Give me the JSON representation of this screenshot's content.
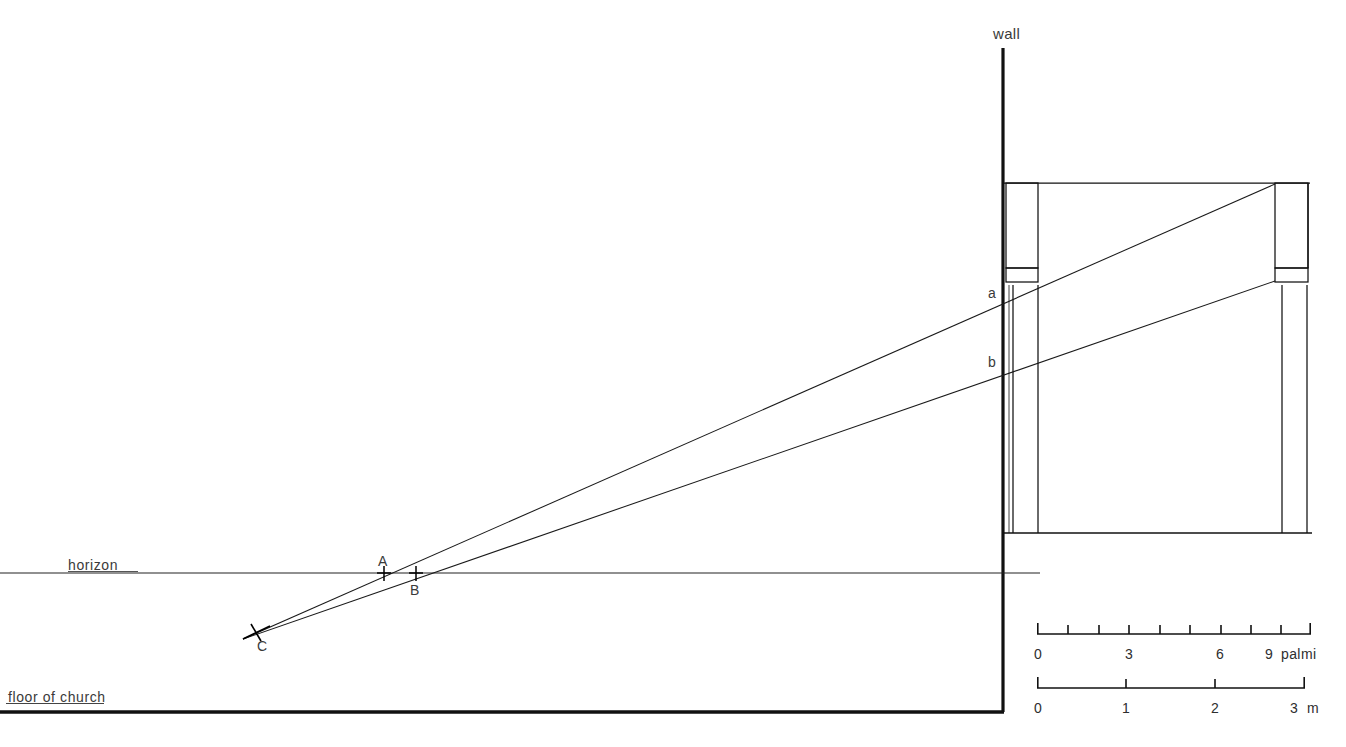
{
  "figure": {
    "type": "architectural-perspective-section-diagram",
    "background_color": "#ffffff",
    "line_color": "#000000",
    "text_color": "#333333",
    "width": 1346,
    "height": 747
  },
  "labels": {
    "wall": "wall",
    "horizon": "horizon",
    "floor_of_church": "floor of church",
    "point_a_lower": "a",
    "point_b_lower": "b",
    "point_A": "A",
    "point_B": "B",
    "point_C": "C"
  },
  "scales": [
    {
      "name": "palmi-scale",
      "unit": "palmi",
      "unit_label": "palmi",
      "ticks": [
        0,
        1,
        2,
        3,
        4,
        5,
        6,
        7,
        8,
        9
      ],
      "major_ticks": [
        0,
        3,
        6,
        9
      ],
      "tick_labels": [
        "0",
        "3",
        "6",
        "9"
      ],
      "label_positions": [
        0,
        3,
        6,
        9
      ],
      "x_start_px": 1037,
      "x_end_px": 1311,
      "y_px": 634,
      "tick_label_y_px": 651
    },
    {
      "name": "metre-scale",
      "unit": "m",
      "unit_label": "m",
      "ticks": [
        0,
        1,
        2,
        3
      ],
      "major_ticks": [
        0,
        1,
        2,
        3
      ],
      "tick_labels": [
        "0",
        "1",
        "2",
        "3"
      ],
      "label_positions": [
        0,
        1,
        2,
        3
      ],
      "x_start_px": 1037,
      "x_end_px": 1305,
      "y_px": 688,
      "tick_label_y_px": 705
    }
  ],
  "geometry": {
    "wall": {
      "x": 1003,
      "y_top": 48,
      "y_bottom": 712,
      "stroke_width": 3.2
    },
    "floor_line": {
      "x_start": 0,
      "x_end": 1004,
      "y": 712,
      "stroke_width": 3.4
    },
    "floor_label_underline": {
      "x_start": 6,
      "x_end": 104,
      "y": 703
    },
    "horizon_line": {
      "x_start": 0,
      "x_end": 1040,
      "y": 573,
      "stroke_width": 1.1
    },
    "horizon_label_underline": {
      "x_start": 68,
      "x_end": 138,
      "y": 571
    },
    "vanishing_point_C": {
      "x": 256,
      "y": 632
    },
    "markers": [
      {
        "name": "A",
        "x": 384,
        "y": 573,
        "angle_deg": 0,
        "size": 13
      },
      {
        "name": "B",
        "x": 416,
        "y": 573,
        "angle_deg": 0,
        "size": 13
      },
      {
        "name": "C",
        "x": 256,
        "y": 632,
        "angle_deg": 28,
        "size": 14
      }
    ],
    "sight_lines": [
      {
        "name": "upper-ray-to-a",
        "x1": 243,
        "y1": 639,
        "x2": 1275,
        "y2": 184
      },
      {
        "name": "lower-ray-to-b",
        "x1": 243,
        "y1": 639,
        "x2": 1275,
        "y2": 281
      }
    ],
    "structure": {
      "base_line": {
        "x_start": 1003,
        "x_end": 1312,
        "y": 533
      },
      "entablature_top": {
        "x_start": 1003,
        "x_end": 1310,
        "y": 183
      },
      "left_pier": {
        "upper_box": {
          "x": 1006,
          "y": 183,
          "w": 32,
          "h": 99
        },
        "capital_band": {
          "x": 1006,
          "y": 268,
          "w": 32,
          "h": 14
        },
        "shaft": {
          "x": 1013,
          "y": 285,
          "w": 25,
          "h": 248
        }
      },
      "right_pier": {
        "upper_box": {
          "x": 1275,
          "y": 183,
          "w": 33,
          "h": 99
        },
        "capital_band": {
          "x": 1275,
          "y": 268,
          "w": 33,
          "h": 14
        },
        "shaft": {
          "x": 1282,
          "y": 285,
          "w": 25,
          "h": 248
        }
      }
    }
  }
}
